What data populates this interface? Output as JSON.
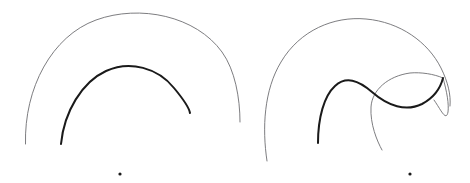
{
  "canvas": {
    "width": 470,
    "height": 183,
    "background_color": "#ffffff",
    "description": "Two line-art figures of overlapping circular arcs and curves"
  },
  "styles": {
    "thin_stroke_color": "#6e6e72",
    "thin_stroke_width": 0.9,
    "thick_stroke_color": "#1a1a1a",
    "thick_stroke_width": 2.0,
    "dot_color": "#1a1a1a"
  },
  "figures": [
    {
      "id": "figure-left",
      "name": "left-nested-arcs",
      "paths": [
        {
          "id": "left-outer-thin-arc",
          "name": "outer-thin-arc",
          "weight": "thin",
          "color": "#6e6e72",
          "width": 0.9,
          "d": "M 25.5 144 C 24 88 52 36 96 20 C 140 4 196 16 222 52 C 235 70 240 98 240 122"
        },
        {
          "id": "left-inner-thick-arc",
          "name": "inner-thick-arc",
          "weight": "thick",
          "color": "#1a1a1a",
          "width": 2.0,
          "d": "M 61 144 C 64 112 82 82 106 71 C 130 60 158 68 174 88 C 184 100 189 107 190 113"
        }
      ]
    },
    {
      "id": "figure-right",
      "name": "right-overlapping-curves",
      "paths": [
        {
          "id": "right-large-thin-circle",
          "name": "large-thin-circle-arc",
          "weight": "thin",
          "color": "#6e6e72",
          "width": 0.9,
          "d": "M 267 161 C 262 128 264 90 281 62 C 300 30 334 16 366 19 C 400 22 428 42 441 68 C 448 82 451 95 450 106"
        },
        {
          "id": "right-small-thin-circle",
          "name": "small-thin-circle",
          "weight": "thin",
          "color": "#6e6e72",
          "width": 0.9,
          "d": "M 443 78 C 434 74 421 72 410 73 C 388 76 372 90 371 107 C 370 124 377 141 382 150"
        },
        {
          "id": "right-small-thin-circle-upper",
          "name": "small-thin-circle-upper-arc",
          "weight": "thin",
          "color": "#6e6e72",
          "width": 0.9,
          "d": "M 443 78 C 447 92 449 104 448 112 C 446 122 441 110 434 100"
        },
        {
          "id": "right-thick-s-curve",
          "name": "thick-s-curve",
          "weight": "thick",
          "color": "#1a1a1a",
          "width": 2.0,
          "d": "M 318 143 C 318 118 324 96 335 86 C 346 76 358 80 372 92 C 388 106 406 112 422 104 C 435 97 441 86 443 78"
        }
      ]
    }
  ],
  "markers": [
    {
      "id": "dot-left",
      "name": "left-bottom-dot",
      "cx": 120,
      "cy": 174,
      "r": 1.6,
      "color": "#1a1a1a"
    },
    {
      "id": "dot-right",
      "name": "right-bottom-dot",
      "cx": 410,
      "cy": 174,
      "r": 1.6,
      "color": "#1a1a1a"
    }
  ]
}
